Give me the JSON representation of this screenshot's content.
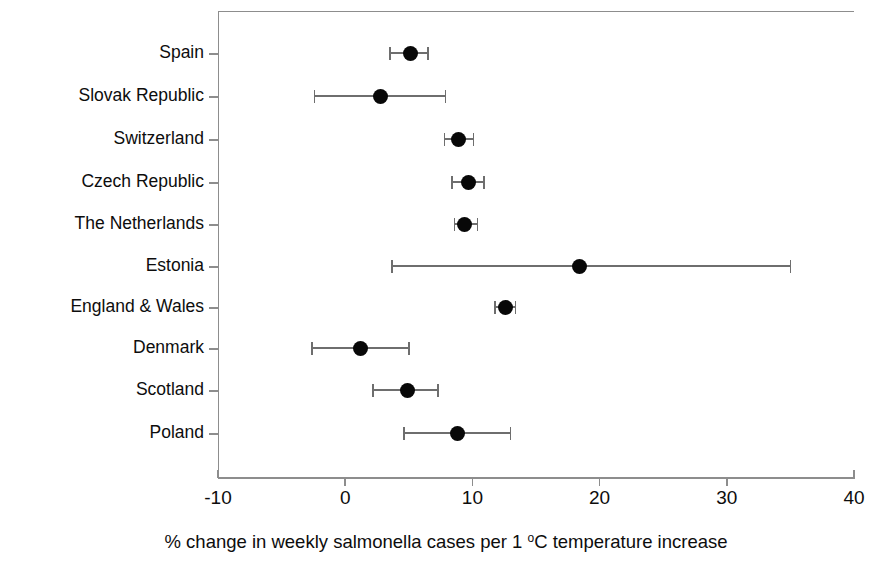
{
  "chart_data": {
    "type": "scatter",
    "title": "",
    "subtitle": "",
    "xlabel": "% change in weekly salmonella cases per 1 °C temperature increase",
    "ylabel": "",
    "xlim": [
      -10,
      40
    ],
    "xticks": [
      -10,
      0,
      10,
      20,
      30,
      40
    ],
    "xtick_labels": [
      "-10",
      "0",
      "10",
      "20",
      "30",
      "40"
    ],
    "grid": false,
    "legend": "none",
    "orientation": "horizontal",
    "error_bars": "95% confidence interval",
    "categories": [
      "Spain",
      "Slovak Republic",
      "Switzerland",
      "Czech Republic",
      "The Netherlands",
      "Estonia",
      "England & Wales",
      "Denmark",
      "Scotland",
      "Poland"
    ],
    "points": [
      {
        "label": "Spain",
        "value": 5.1,
        "low": 3.5,
        "high": 6.5
      },
      {
        "label": "Slovak Republic",
        "value": 2.8,
        "low": -2.4,
        "high": 7.9
      },
      {
        "label": "Switzerland",
        "value": 8.9,
        "low": 7.8,
        "high": 10.1
      },
      {
        "label": "Czech Republic",
        "value": 9.7,
        "low": 8.4,
        "high": 10.9
      },
      {
        "label": "The Netherlands",
        "value": 9.4,
        "low": 8.6,
        "high": 10.4
      },
      {
        "label": "Estonia",
        "value": 18.4,
        "low": 3.7,
        "high": 35.0
      },
      {
        "label": "England & Wales",
        "value": 12.6,
        "low": 11.8,
        "high": 13.4
      },
      {
        "label": "Denmark",
        "value": 1.2,
        "low": -2.6,
        "high": 5.0
      },
      {
        "label": "Scotland",
        "value": 4.9,
        "low": 2.2,
        "high": 7.3
      },
      {
        "label": "Poland",
        "value": 8.8,
        "low": 4.6,
        "high": 13.0
      }
    ],
    "values": [
      5.1,
      2.8,
      8.9,
      9.7,
      9.4,
      18.4,
      12.6,
      1.2,
      4.9,
      8.8
    ],
    "colors": {
      "marker": "#080808",
      "error_bar": "#6e6e6e",
      "axis": "#8d8d8d",
      "text": "#0d0d0d",
      "background": "#ffffff"
    }
  },
  "caption": {
    "prefix": "% change in weekly salmonella cases per 1 ",
    "degree": "o",
    "suffix": "C temperature increase"
  }
}
